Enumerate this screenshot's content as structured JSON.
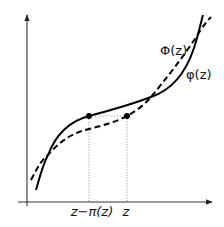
{
  "diagram": {
    "curves": [
      {
        "name": "phi_lower",
        "label": "φ(z)",
        "style": "solid",
        "color": "#000000"
      },
      {
        "name": "Phi_upper",
        "label": "Φ(z)",
        "style": "dashed",
        "color": "#000000"
      }
    ],
    "x_tick_labels": {
      "left": "z−π(z)",
      "right": "z"
    },
    "points": [
      {
        "name": "point-on-phi",
        "at": "z−π(z)"
      },
      {
        "name": "point-on-Phi",
        "at": "z"
      }
    ],
    "axes": {
      "x_arrow": true,
      "y_arrow": true
    },
    "colors": {
      "curve": "#000000",
      "axis": "#333333",
      "guide": "#888888",
      "background": "#ffffff"
    }
  }
}
